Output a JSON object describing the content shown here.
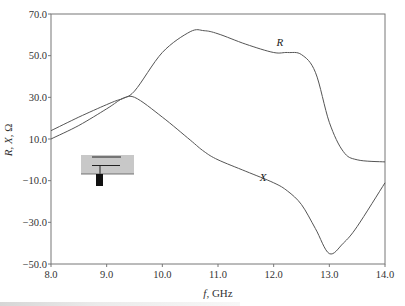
{
  "chart_data": {
    "type": "line",
    "title": "",
    "xlabel": "f, GHz",
    "ylabel": "R, X, Ω",
    "xlim": [
      8.0,
      14.0
    ],
    "ylim": [
      -50.0,
      70.0
    ],
    "grid": false,
    "legend": "inline labels",
    "x_ticks": [
      "8.0",
      "9.0",
      "10.0",
      "11.0",
      "12.0",
      "13.0",
      "14.0"
    ],
    "y_ticks": [
      "70.0",
      "50.0",
      "30.0",
      "10.0",
      "-10.0",
      "-30.0",
      "-50.0"
    ],
    "x": [
      8.0,
      8.5,
      9.0,
      9.25,
      9.5,
      10.0,
      10.5,
      10.75,
      11.0,
      11.5,
      12.0,
      12.25,
      12.5,
      12.75,
      13.0,
      13.25,
      13.5,
      14.0
    ],
    "series": [
      {
        "name": "R",
        "values": [
          10.0,
          16.5,
          24.5,
          29.0,
          33.0,
          51.5,
          61.5,
          62.0,
          60.5,
          55.5,
          51.5,
          51.5,
          50.5,
          42.0,
          18.0,
          4.0,
          0.0,
          -1.0
        ],
        "label_pos": {
          "x": 12.05,
          "y": 54.5
        }
      },
      {
        "name": "X",
        "values": [
          14.0,
          20.5,
          26.5,
          29.0,
          30.0,
          20.5,
          9.5,
          4.0,
          0.0,
          -5.5,
          -11.0,
          -15.0,
          -21.5,
          -33.0,
          -45.0,
          -40.0,
          -32.0,
          -11.0
        ],
        "label_pos": {
          "x": 11.75,
          "y": -10.0
        }
      }
    ]
  },
  "inset": {
    "description": "antenna-element schematic",
    "fill": "#c8c8c8",
    "line_color": "#111111"
  },
  "colors": {
    "curve": "#555555",
    "axis": "#777777"
  }
}
